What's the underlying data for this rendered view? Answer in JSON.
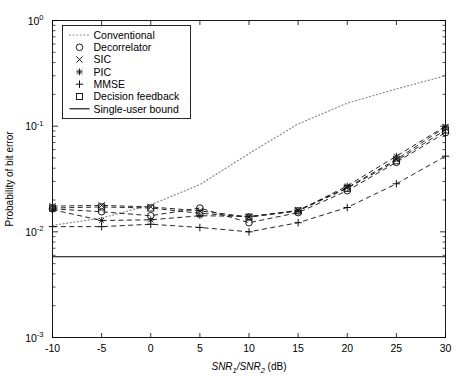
{
  "chart_data": {
    "type": "line",
    "title": "",
    "xlabel": "SNR1/SNR2 (dB)",
    "ylabel": "Probability of bit error",
    "xlim": [
      -10,
      30
    ],
    "ylim": [
      0.001,
      1
    ],
    "yscale": "log",
    "xscale": "linear",
    "grid": false,
    "legend_position": "upper left",
    "xticks": [
      "-10",
      "-5",
      "0",
      "5",
      "10",
      "15",
      "20",
      "25",
      "30"
    ],
    "xtick_values": [
      -10,
      -5,
      0,
      5,
      10,
      15,
      20,
      25,
      30
    ],
    "ytick_labels": [
      "10",
      "10",
      "10",
      "10"
    ],
    "ytick_exponents": [
      "0",
      "-1",
      "-2",
      "-3"
    ],
    "ytick_values": [
      1,
      0.1,
      0.01,
      0.001
    ],
    "x": [
      -10,
      -5,
      0,
      5,
      10,
      15,
      20,
      25,
      30
    ],
    "series": [
      {
        "name": "Conventional",
        "marker": "none",
        "linestyle": "dotted",
        "values": [
          0.0115,
          0.0135,
          0.018,
          0.028,
          0.055,
          0.105,
          0.165,
          0.225,
          0.3
        ]
      },
      {
        "name": "Decorrelator",
        "marker": "circle",
        "linestyle": "dashed",
        "values": [
          0.0165,
          0.0155,
          0.0142,
          0.0168,
          0.0122,
          0.0152,
          0.0245,
          0.0455,
          0.087
        ]
      },
      {
        "name": "SIC",
        "marker": "x",
        "linestyle": "dashed",
        "values": [
          0.0175,
          0.0178,
          0.0172,
          0.0158,
          0.0138,
          0.016,
          0.0262,
          0.0485,
          0.098
        ]
      },
      {
        "name": "PIC",
        "marker": "star",
        "linestyle": "dashed",
        "values": [
          0.0162,
          0.0128,
          0.013,
          0.0142,
          0.014,
          0.0158,
          0.0272,
          0.052,
          0.1
        ]
      },
      {
        "name": "MMSE",
        "marker": "plus",
        "linestyle": "dashed",
        "values": [
          0.0112,
          0.0112,
          0.0118,
          0.011,
          0.01,
          0.0122,
          0.017,
          0.0285,
          0.052
        ]
      },
      {
        "name": "Decision feedback",
        "marker": "square",
        "linestyle": "dashed",
        "values": [
          0.0168,
          0.0172,
          0.0168,
          0.015,
          0.0138,
          0.0158,
          0.0258,
          0.047,
          0.092
        ]
      },
      {
        "name": "Single-user bound",
        "marker": "none",
        "linestyle": "solid",
        "values": [
          0.0058,
          0.0058,
          0.0058,
          0.0058,
          0.0058,
          0.0058,
          0.0058,
          0.0058,
          0.0058
        ]
      }
    ]
  },
  "legend": {
    "items": [
      {
        "label": "Conventional",
        "marker": "dotted-line"
      },
      {
        "label": "Decorrelator",
        "marker": "circle"
      },
      {
        "label": "SIC",
        "marker": "x"
      },
      {
        "label": "PIC",
        "marker": "star"
      },
      {
        "label": "MMSE",
        "marker": "plus"
      },
      {
        "label": "Decision feedback",
        "marker": "square"
      },
      {
        "label": "Single-user bound",
        "marker": "solid-line"
      }
    ]
  },
  "axis": {
    "ylabel": "Probability of bit error",
    "xlabel_main": "SNR",
    "xlabel_sub1": "1",
    "xlabel_slash": "/SNR",
    "xlabel_sub2": "2",
    "xlabel_unit": " (dB)"
  },
  "colors": {
    "axis": "#000000",
    "curve": "#1a1a1a",
    "conventional": "#8a8a8a",
    "background": "#ffffff"
  }
}
